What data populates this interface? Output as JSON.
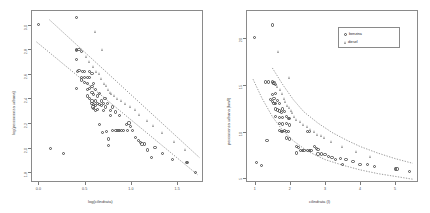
{
  "figure": {
    "background": "#ffffff",
    "panel_count": 2,
    "point_color_benzina": "#4d4d4d",
    "point_color_diesel": "#9a9a9a",
    "fit_line_color": "#6f6f6f"
  },
  "chart_data": [
    {
      "type": "scatter",
      "panel": "left",
      "title": "",
      "xlabel": "log(cilindrata)",
      "ylabel": "log(percorrenza urbana)",
      "xlim": [
        -0.08,
        1.78
      ],
      "ylim": [
        1.72,
        3.12
      ],
      "xticks": [
        0.0,
        0.5,
        1.0,
        1.5
      ],
      "xticklabels": [
        "0.0",
        "0.5",
        "1.0",
        "1.5"
      ],
      "yticks": [
        1.8,
        2.0,
        2.2,
        2.4,
        2.6,
        2.8,
        3.0
      ],
      "yticklabels": [
        "1.8",
        "2.0",
        "2.2",
        "2.4",
        "2.6",
        "2.8",
        "3.0"
      ],
      "grid": false,
      "legend": null,
      "series": [
        {
          "name": "benzina",
          "marker": "circle",
          "points": [
            [
              0.0,
              3.0
            ],
            [
              0.13,
              1.99
            ],
            [
              0.27,
              1.95
            ],
            [
              0.41,
              3.06
            ],
            [
              0.41,
              2.8
            ],
            [
              0.41,
              2.79
            ],
            [
              0.41,
              2.72
            ],
            [
              0.42,
              2.62
            ],
            [
              0.44,
              2.8
            ],
            [
              0.44,
              2.63
            ],
            [
              0.47,
              2.78
            ],
            [
              0.47,
              2.57
            ],
            [
              0.48,
              2.62
            ],
            [
              0.41,
              2.48
            ],
            [
              0.47,
              2.55
            ],
            [
              0.5,
              2.62
            ],
            [
              0.5,
              2.57
            ],
            [
              0.5,
              2.53
            ],
            [
              0.53,
              2.57
            ],
            [
              0.53,
              2.52
            ],
            [
              0.53,
              2.47
            ],
            [
              0.53,
              2.42
            ],
            [
              0.55,
              2.62
            ],
            [
              0.55,
              2.57
            ],
            [
              0.55,
              2.48
            ],
            [
              0.55,
              2.4
            ],
            [
              0.58,
              2.6
            ],
            [
              0.58,
              2.5
            ],
            [
              0.58,
              2.45
            ],
            [
              0.58,
              2.38
            ],
            [
              0.58,
              2.36
            ],
            [
              0.59,
              2.33
            ],
            [
              0.6,
              2.52
            ],
            [
              0.6,
              2.43
            ],
            [
              0.6,
              2.35
            ],
            [
              0.6,
              2.32
            ],
            [
              0.62,
              2.47
            ],
            [
              0.62,
              2.38
            ],
            [
              0.62,
              2.34
            ],
            [
              0.62,
              2.3
            ],
            [
              0.64,
              2.42
            ],
            [
              0.64,
              2.36
            ],
            [
              0.64,
              2.31
            ],
            [
              0.66,
              2.44
            ],
            [
              0.66,
              2.35
            ],
            [
              0.66,
              2.19
            ],
            [
              0.68,
              2.38
            ],
            [
              0.68,
              2.34
            ],
            [
              0.69,
              2.12
            ],
            [
              0.7,
              2.36
            ],
            [
              0.7,
              2.3
            ],
            [
              0.72,
              2.4
            ],
            [
              0.73,
              2.33
            ],
            [
              0.74,
              2.13
            ],
            [
              0.75,
              2.36
            ],
            [
              0.76,
              2.07
            ],
            [
              0.76,
              2.02
            ],
            [
              0.78,
              2.3
            ],
            [
              0.78,
              2.26
            ],
            [
              0.8,
              2.33
            ],
            [
              0.8,
              2.14
            ],
            [
              0.83,
              2.29
            ],
            [
              0.84,
              2.14
            ],
            [
              0.86,
              2.14
            ],
            [
              0.88,
              2.26
            ],
            [
              0.88,
              2.14
            ],
            [
              0.9,
              2.14
            ],
            [
              0.92,
              2.14
            ],
            [
              0.95,
              2.19
            ],
            [
              0.96,
              2.14
            ],
            [
              0.98,
              2.2
            ],
            [
              1.0,
              2.17
            ],
            [
              1.02,
              2.14
            ],
            [
              1.05,
              2.08
            ],
            [
              1.08,
              2.06
            ],
            [
              1.1,
              2.04
            ],
            [
              1.12,
              2.03
            ],
            [
              1.15,
              2.03
            ],
            [
              1.18,
              1.98
            ],
            [
              1.22,
              1.92
            ],
            [
              1.26,
              2.0
            ],
            [
              1.34,
              1.95
            ],
            [
              1.45,
              1.9
            ],
            [
              1.6,
              1.88
            ],
            [
              1.61,
              1.88
            ],
            [
              1.7,
              1.8
            ]
          ]
        },
        {
          "name": "diesel",
          "marker": "triangle",
          "points": [
            [
              0.62,
              2.94
            ],
            [
              0.47,
              2.8
            ],
            [
              0.52,
              2.74
            ],
            [
              0.56,
              2.7
            ],
            [
              0.6,
              2.66
            ],
            [
              0.63,
              2.62
            ],
            [
              0.66,
              2.6
            ],
            [
              0.69,
              2.56
            ],
            [
              0.7,
              2.8
            ],
            [
              0.72,
              2.52
            ],
            [
              0.74,
              2.5
            ],
            [
              0.76,
              2.47
            ],
            [
              0.78,
              2.45
            ],
            [
              0.8,
              2.44
            ],
            [
              0.83,
              2.42
            ],
            [
              0.86,
              2.4
            ],
            [
              0.9,
              2.38
            ],
            [
              0.95,
              2.36
            ],
            [
              1.0,
              2.33
            ],
            [
              1.05,
              2.31
            ],
            [
              1.1,
              2.27
            ],
            [
              1.18,
              2.22
            ],
            [
              1.25,
              2.18
            ],
            [
              1.35,
              2.12
            ],
            [
              1.48,
              2.05
            ],
            [
              1.6,
              1.98
            ]
          ]
        }
      ],
      "fits": [
        {
          "name": "benzina-fit",
          "style": "dotted",
          "from": [
            -0.02,
            2.86
          ],
          "to": [
            1.72,
            1.78
          ]
        },
        {
          "name": "diesel-fit",
          "style": "dotted",
          "from": [
            0.12,
            3.04
          ],
          "to": [
            1.74,
            1.92
          ]
        }
      ]
    },
    {
      "type": "scatter",
      "panel": "right",
      "title": "",
      "xlabel": "cilindrata (l)",
      "ylabel": "percorrenza urbana (km/l)",
      "xlim": [
        0.75,
        5.65
      ],
      "ylim": [
        4.6,
        23.0
      ],
      "xticks": [
        1,
        2,
        3,
        4,
        5
      ],
      "xticklabels": [
        "1",
        "2",
        "3",
        "4",
        "5"
      ],
      "yticks": [
        5,
        10,
        15,
        20
      ],
      "yticklabels": [
        "5",
        "10",
        "15",
        "20"
      ],
      "grid": false,
      "legend": {
        "position": "top-right",
        "entries": [
          {
            "label": "benzina",
            "marker": "circle"
          },
          {
            "label": "diesel",
            "marker": "triangle"
          }
        ]
      },
      "series": [
        {
          "name": "benzina",
          "marker": "circle",
          "points": [
            [
              1.0,
              20.1
            ],
            [
              1.35,
              9.0
            ],
            [
              1.5,
              21.4
            ],
            [
              1.55,
              15.2
            ],
            [
              1.3,
              15.3
            ],
            [
              1.4,
              15.3
            ],
            [
              1.5,
              15.3
            ],
            [
              1.55,
              15.1
            ],
            [
              1.6,
              15.0
            ],
            [
              1.5,
              14.0
            ],
            [
              1.6,
              14.1
            ],
            [
              1.55,
              13.5
            ],
            [
              1.45,
              13.4
            ],
            [
              1.5,
              13.2
            ],
            [
              1.55,
              13.0
            ],
            [
              1.6,
              13.0
            ],
            [
              1.65,
              13.3
            ],
            [
              1.7,
              13.0
            ],
            [
              1.6,
              12.4
            ],
            [
              1.65,
              12.3
            ],
            [
              1.7,
              12.2
            ],
            [
              1.75,
              12.0
            ],
            [
              1.8,
              12.4
            ],
            [
              1.85,
              12.1
            ],
            [
              1.6,
              11.6
            ],
            [
              1.7,
              11.5
            ],
            [
              1.8,
              11.5
            ],
            [
              1.9,
              11.6
            ],
            [
              1.95,
              11.4
            ],
            [
              2.0,
              11.4
            ],
            [
              1.7,
              10.9
            ],
            [
              1.8,
              10.8
            ],
            [
              1.9,
              10.9
            ],
            [
              2.0,
              10.7
            ],
            [
              1.7,
              10.1
            ],
            [
              1.75,
              10.0
            ],
            [
              1.8,
              10.0
            ],
            [
              1.85,
              10.1
            ],
            [
              1.9,
              10.0
            ],
            [
              1.95,
              10.0
            ],
            [
              2.5,
              10.0
            ],
            [
              2.55,
              10.0
            ],
            [
              1.9,
              9.3
            ],
            [
              2.0,
              9.2
            ],
            [
              2.2,
              8.4
            ],
            [
              2.25,
              8.3
            ],
            [
              2.2,
              7.7
            ],
            [
              2.3,
              8.0
            ],
            [
              2.35,
              8.0
            ],
            [
              2.4,
              8.0
            ],
            [
              2.5,
              8.0
            ],
            [
              2.55,
              8.0
            ],
            [
              2.6,
              8.0
            ],
            [
              2.7,
              8.4
            ],
            [
              2.75,
              8.2
            ],
            [
              2.8,
              8.1
            ],
            [
              2.8,
              7.6
            ],
            [
              2.9,
              7.6
            ],
            [
              3.0,
              7.5
            ],
            [
              3.1,
              7.3
            ],
            [
              3.2,
              7.2
            ],
            [
              3.3,
              7.0
            ],
            [
              3.45,
              7.1
            ],
            [
              3.5,
              6.5
            ],
            [
              3.6,
              7.0
            ],
            [
              3.8,
              6.8
            ],
            [
              4.0,
              6.5
            ],
            [
              4.2,
              6.5
            ],
            [
              4.4,
              6.3
            ],
            [
              5.0,
              6.0
            ],
            [
              5.05,
              6.0
            ],
            [
              5.4,
              5.7
            ],
            [
              1.05,
              6.7
            ],
            [
              1.2,
              6.4
            ]
          ]
        },
        {
          "name": "diesel",
          "marker": "triangle",
          "points": [
            [
              1.7,
              18.5
            ],
            [
              1.6,
              15.2
            ],
            [
              1.65,
              14.8
            ],
            [
              1.75,
              14.5
            ],
            [
              1.8,
              14.0
            ],
            [
              1.85,
              13.5
            ],
            [
              1.9,
              13.2
            ],
            [
              1.95,
              12.8
            ],
            [
              2.0,
              12.5
            ],
            [
              2.05,
              12.2
            ],
            [
              2.1,
              12.0
            ],
            [
              2.15,
              11.6
            ],
            [
              2.0,
              15.8
            ],
            [
              2.2,
              11.3
            ],
            [
              2.3,
              11.0
            ],
            [
              2.4,
              10.7
            ],
            [
              2.5,
              10.5
            ],
            [
              2.6,
              10.2
            ],
            [
              2.7,
              10.0
            ],
            [
              2.8,
              9.7
            ],
            [
              2.9,
              9.5
            ],
            [
              3.0,
              9.3
            ],
            [
              3.2,
              8.9
            ],
            [
              3.5,
              8.4
            ],
            [
              3.9,
              7.8
            ],
            [
              4.3,
              7.3
            ]
          ]
        }
      ],
      "fits": [
        {
          "name": "benzina-fit",
          "style": "dotted",
          "curve": [
            [
              0.95,
              15.6
            ],
            [
              1.2,
              13.6
            ],
            [
              1.5,
              11.6
            ],
            [
              1.8,
              10.1
            ],
            [
              2.1,
              9.0
            ],
            [
              2.5,
              7.9
            ],
            [
              3.0,
              7.0
            ],
            [
              3.5,
              6.4
            ],
            [
              4.0,
              5.9
            ],
            [
              4.5,
              5.5
            ],
            [
              5.0,
              5.2
            ],
            [
              5.5,
              4.9
            ]
          ]
        },
        {
          "name": "diesel-fit",
          "style": "dotted",
          "curve": [
            [
              1.5,
              16.8
            ],
            [
              1.8,
              15.0
            ],
            [
              2.1,
              13.4
            ],
            [
              2.4,
              12.1
            ],
            [
              2.8,
              10.9
            ],
            [
              3.2,
              9.9
            ],
            [
              3.6,
              9.1
            ],
            [
              4.0,
              8.4
            ],
            [
              4.5,
              7.7
            ],
            [
              5.0,
              7.1
            ],
            [
              5.5,
              6.6
            ]
          ]
        }
      ]
    }
  ]
}
